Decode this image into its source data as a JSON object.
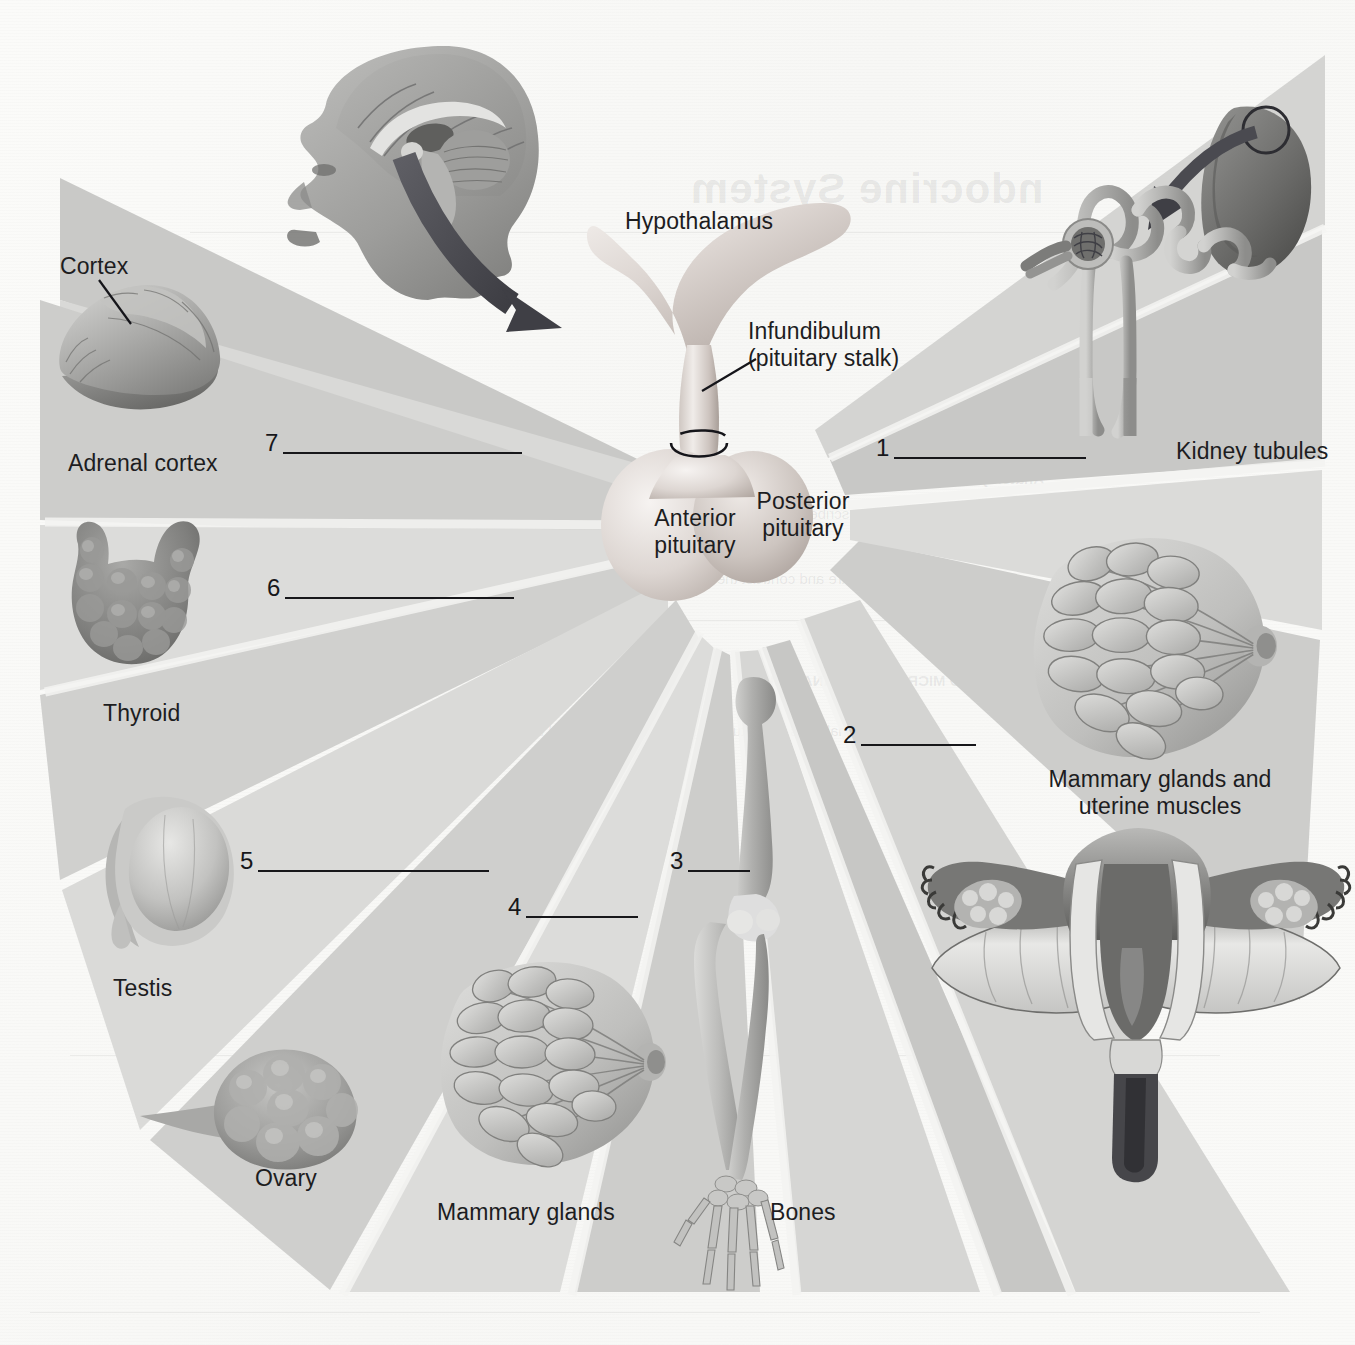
{
  "figure": {
    "type": "labeled anatomy worksheet"
  },
  "center": {
    "hypothalamus": "Hypothalamus",
    "infundibulum_line1": "Infundibulum",
    "infundibulum_line2": "(pituitary stalk)",
    "anterior_line1": "Anterior",
    "anterior_line2": "pituitary",
    "posterior_line1": "Posterior",
    "posterior_line2": "pituitary"
  },
  "organs": [
    {
      "id": "adrenal-cortex",
      "label": "Adrenal cortex",
      "sublabel": "Cortex"
    },
    {
      "id": "thyroid",
      "label": "Thyroid"
    },
    {
      "id": "testis",
      "label": "Testis"
    },
    {
      "id": "ovary",
      "label": "Ovary"
    },
    {
      "id": "mammary-glands",
      "label": "Mammary glands"
    },
    {
      "id": "bones",
      "label": "Bones"
    },
    {
      "id": "kidney-tubules",
      "label": "Kidney tubules"
    },
    {
      "id": "mammary-uterine",
      "label_line1": "Mammary glands and",
      "label_line2": "uterine muscles"
    }
  ],
  "blanks": [
    {
      "number": "1",
      "target": "kidney-tubules",
      "length": 192
    },
    {
      "number": "2",
      "target": "mammary-uterine",
      "length": 115
    },
    {
      "number": "3",
      "target": "bones",
      "length": 62
    },
    {
      "number": "4",
      "target": "mammary-glands",
      "length": 112
    },
    {
      "number": "5",
      "target": "testis",
      "length": 231
    },
    {
      "number": "6",
      "target": "thyroid",
      "length": 229
    },
    {
      "number": "7",
      "target": "adrenal-cortex",
      "length": 239
    }
  ],
  "bleed_through": {
    "heading": "ndocrine System",
    "lines": [
      "OBJECTIVES",
      "Anatomy",
      "Describe the location of the hypothalamus and",
      "pituitary",
      "Compare and contrast the development of the anterior",
      "and posterior pituitary",
      "GROSS AND MICROSCOPIC ANATOMY",
      "The hypothalamus and pituitary gland form a functional unit"
    ]
  },
  "colors": {
    "paper": "#fbfbf9",
    "wedge_light": "#e4e4e2",
    "wedge_mid": "#d2d2d0",
    "wedge_dark": "#c2c2c0",
    "ink": "#17171a",
    "arrow": "#4a4a50"
  }
}
